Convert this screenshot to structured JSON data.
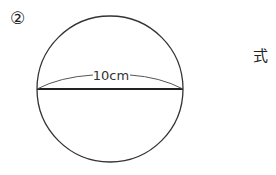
{
  "problem": {
    "number_label": "②",
    "formula_label": "式"
  },
  "figure": {
    "shape": "circle",
    "diameter_label": "10cm",
    "stroke_color": "#333333"
  }
}
